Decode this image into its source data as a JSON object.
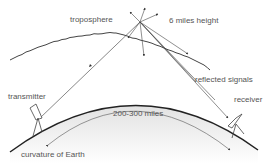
{
  "diagram": {
    "labels": {
      "troposphere": "troposphere",
      "height": "6 miles height",
      "reflected": "reflected signals",
      "transmitter": "transmitter",
      "receiver": "receiver",
      "distance": "200-300 miles",
      "earth": "curvature of Earth"
    },
    "colors": {
      "line": "#333333",
      "text": "#555555",
      "earth_shade": "#d8d8d8"
    }
  }
}
